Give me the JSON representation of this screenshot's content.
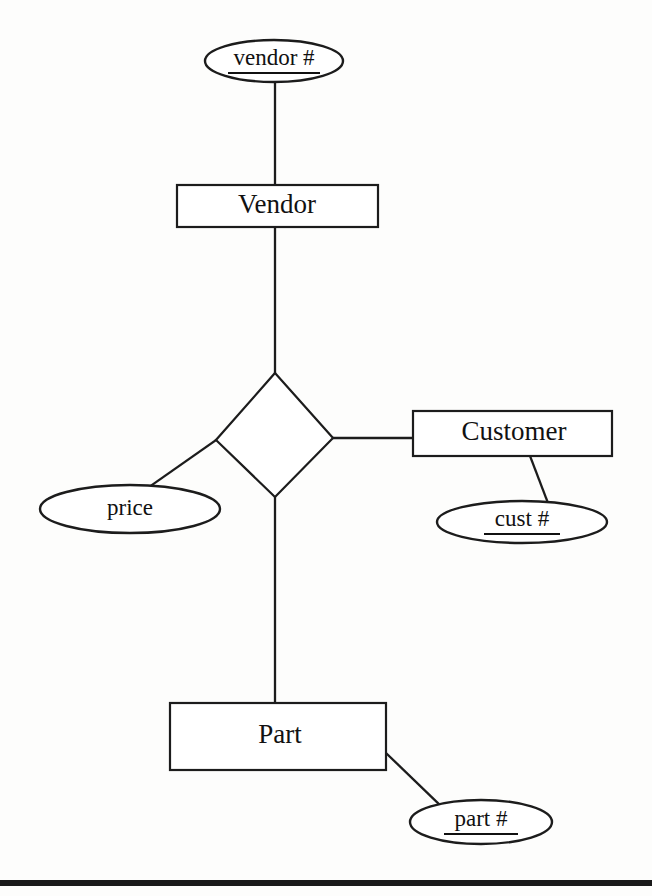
{
  "diagram": {
    "notation": "Chen ER notation",
    "background_color": "#fdfdfc",
    "line_color": "#1c1c1c",
    "text_color": "#111111",
    "entities": [
      {
        "id": "vendor",
        "label": "Vendor",
        "x": 177,
        "y": 185,
        "w": 201,
        "h": 42
      },
      {
        "id": "customer",
        "label": "Customer",
        "x": 413,
        "y": 411,
        "w": 199,
        "h": 45
      },
      {
        "id": "part",
        "label": "Part",
        "x": 170,
        "y": 703,
        "w": 216,
        "h": 67
      }
    ],
    "relationships": [
      {
        "id": "supplies",
        "label": "",
        "cx": 275,
        "cy": 435,
        "rx": 59,
        "ry": 62
      }
    ],
    "attributes": [
      {
        "id": "vendor-num",
        "label": "vendor #",
        "cx": 274,
        "cy": 61,
        "rx": 69,
        "ry": 21,
        "key": true,
        "underline_width": 92
      },
      {
        "id": "price",
        "label": "price",
        "cx": 130,
        "cy": 509,
        "rx": 90,
        "ry": 24,
        "key": false,
        "underline_width": 0
      },
      {
        "id": "cust-num",
        "label": "cust #",
        "cx": 522,
        "cy": 522,
        "rx": 85,
        "ry": 21,
        "key": true,
        "underline_width": 76
      },
      {
        "id": "part-num",
        "label": "part #",
        "cx": 481,
        "cy": 822,
        "rx": 71,
        "ry": 22,
        "key": true,
        "underline_width": 74
      }
    ],
    "connectors": [
      {
        "id": "vendornum-to-vendor",
        "from": "vendor-num",
        "to": "vendor",
        "x1": 275,
        "y1": 82,
        "x2": 275,
        "y2": 185
      },
      {
        "id": "vendor-to-relationship",
        "from": "vendor",
        "to": "supplies",
        "x1": 275,
        "y1": 227,
        "x2": 275,
        "y2": 373
      },
      {
        "id": "relationship-to-price",
        "from": "supplies",
        "to": "price",
        "x1": 216,
        "y1": 440,
        "x2": 152,
        "y2": 485
      },
      {
        "id": "relationship-to-customer",
        "from": "supplies",
        "to": "customer",
        "x1": 333,
        "y1": 438,
        "x2": 413,
        "y2": 438
      },
      {
        "id": "customer-to-custnum",
        "from": "customer",
        "to": "cust-num",
        "x1": 530,
        "y1": 456,
        "x2": 548,
        "y2": 503
      },
      {
        "id": "relationship-to-part",
        "from": "supplies",
        "to": "part",
        "x1": 275,
        "y1": 497,
        "x2": 275,
        "y2": 703
      },
      {
        "id": "part-to-partnum",
        "from": "part",
        "to": "part-num",
        "x1": 386,
        "y1": 753,
        "x2": 441,
        "y2": 806
      }
    ],
    "footer_rule": {
      "y": 880,
      "height": 6,
      "color": "#1a1a1a"
    }
  }
}
